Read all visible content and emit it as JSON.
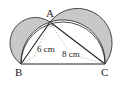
{
  "diagram": {
    "points": {
      "A": {
        "label": "A",
        "x": 50,
        "y": 22
      },
      "B": {
        "label": "B",
        "x": 21,
        "y": 64
      },
      "C": {
        "label": "C",
        "x": 105,
        "y": 64
      }
    },
    "edge_labels": {
      "AB": "6 cm",
      "AC": "8 cm"
    },
    "colors": {
      "shade": "#c8c8c8",
      "line": "#222222",
      "dashed": "#999999"
    }
  }
}
